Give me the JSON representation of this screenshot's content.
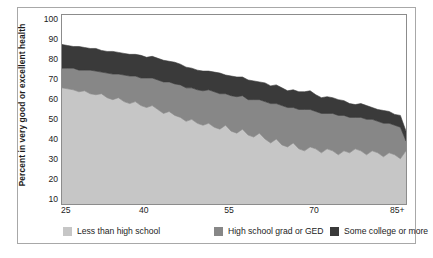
{
  "chart_data": {
    "type": "area",
    "stacked": true,
    "title": "",
    "subtitle": "",
    "xlabel": "",
    "ylabel": "Percent in very good or excellent health",
    "xlim": [
      25,
      86
    ],
    "ylim": [
      7,
      103
    ],
    "grid": false,
    "legend_position": "bottom",
    "xticks": [
      {
        "value": 25,
        "label": "25"
      },
      {
        "value": 40,
        "label": "40"
      },
      {
        "value": 55,
        "label": "55"
      },
      {
        "value": 70,
        "label": "70"
      },
      {
        "value": 86,
        "label": "85+"
      }
    ],
    "yticks": [
      {
        "value": 100,
        "label": "100"
      },
      {
        "value": 90,
        "label": "90"
      },
      {
        "value": 80,
        "label": "80"
      },
      {
        "value": 70,
        "label": "70"
      },
      {
        "value": 60,
        "label": "60"
      },
      {
        "value": 50,
        "label": "50"
      },
      {
        "value": 40,
        "label": "40"
      },
      {
        "value": 30,
        "label": "30"
      },
      {
        "value": 20,
        "label": "20"
      },
      {
        "value": 10,
        "label": "10"
      }
    ],
    "x": [
      25,
      26,
      27,
      28,
      29,
      30,
      31,
      32,
      33,
      34,
      35,
      36,
      37,
      38,
      39,
      40,
      41,
      42,
      43,
      44,
      45,
      46,
      47,
      48,
      49,
      50,
      51,
      52,
      53,
      54,
      55,
      56,
      57,
      58,
      59,
      60,
      61,
      62,
      63,
      64,
      65,
      66,
      67,
      68,
      69,
      70,
      71,
      72,
      73,
      74,
      75,
      76,
      77,
      78,
      79,
      80,
      81,
      82,
      83,
      84,
      85,
      86
    ],
    "series": [
      {
        "name": "Less than high school",
        "color": "#c6c6c6",
        "values": [
          66,
          65.5,
          65,
          64,
          64.5,
          63,
          62.5,
          63,
          61,
          60,
          61,
          59,
          58,
          59,
          57,
          56,
          57,
          55,
          53,
          54,
          52,
          51,
          49,
          50,
          48,
          47,
          48,
          46,
          45,
          47,
          44,
          43,
          45,
          42,
          41,
          43,
          40,
          38,
          40,
          37,
          36,
          38,
          35,
          34,
          36,
          35,
          33,
          35,
          34,
          32,
          34,
          33,
          35,
          34,
          32,
          34,
          33,
          31,
          33,
          32,
          30,
          34
        ]
      },
      {
        "name": "High school grad or GED",
        "color": "#878787",
        "values": [
          10,
          10.5,
          11,
          11,
          10.5,
          12,
          12,
          11,
          12.5,
          13,
          12,
          13.5,
          14,
          13,
          14,
          15,
          14,
          15,
          16,
          15,
          16,
          16.5,
          17,
          16,
          17,
          17.5,
          17,
          18,
          18,
          16,
          18,
          18.5,
          17,
          18,
          19,
          17,
          19,
          20,
          18,
          20,
          20,
          18,
          20,
          21,
          19,
          19,
          20,
          18,
          19,
          20,
          18,
          18,
          16,
          17,
          18,
          16,
          16,
          17,
          15,
          15,
          16,
          5
        ]
      },
      {
        "name": "Some college or more",
        "color": "#3a3a3a",
        "values": [
          12,
          11.5,
          11,
          12,
          11.5,
          11,
          11.5,
          11,
          11,
          11.5,
          11,
          11,
          11,
          11,
          11.5,
          10.5,
          11,
          11,
          11,
          10.5,
          11,
          10.5,
          10.5,
          10,
          10,
          10,
          9.5,
          10,
          10.5,
          9.5,
          10,
          10,
          9.5,
          10,
          9.5,
          9,
          9.5,
          9,
          9.5,
          9,
          8.5,
          9,
          9,
          9,
          9.5,
          8.5,
          8,
          8.5,
          8,
          8,
          7.5,
          7,
          6.5,
          7,
          7,
          6,
          6,
          6.5,
          6,
          5.5,
          6,
          5
        ]
      }
    ],
    "legend": [
      {
        "label": "Less than high school",
        "color": "#c6c6c6"
      },
      {
        "label": "High school grad or GED",
        "color": "#878787"
      },
      {
        "label": "Some college or more",
        "color": "#3a3a3a"
      }
    ]
  }
}
